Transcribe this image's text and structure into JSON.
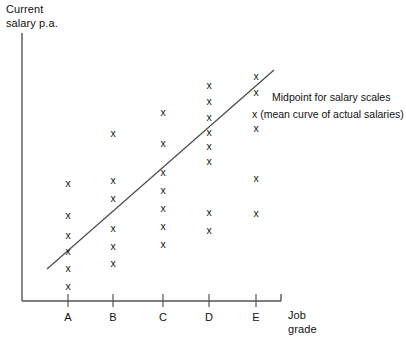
{
  "chart_data": {
    "type": "scatter",
    "title": "",
    "xlabel": "Job grade",
    "ylabel": "Current salary p.a.",
    "categories": [
      "A",
      "B",
      "C",
      "D",
      "E"
    ],
    "grid": false,
    "legend_position": "inside-right",
    "marker_symbol": "x",
    "series": [
      {
        "name": "Actual salaries",
        "type": "scatter",
        "points": [
          {
            "category": "A",
            "x": 68,
            "y": 183
          },
          {
            "category": "A",
            "x": 68,
            "y": 215
          },
          {
            "category": "A",
            "x": 68,
            "y": 235
          },
          {
            "category": "A",
            "x": 68,
            "y": 251
          },
          {
            "category": "A",
            "x": 68,
            "y": 268
          },
          {
            "category": "A",
            "x": 68,
            "y": 286
          },
          {
            "category": "B",
            "x": 113,
            "y": 133
          },
          {
            "category": "B",
            "x": 113,
            "y": 180
          },
          {
            "category": "B",
            "x": 113,
            "y": 198
          },
          {
            "category": "B",
            "x": 113,
            "y": 228
          },
          {
            "category": "B",
            "x": 113,
            "y": 246
          },
          {
            "category": "B",
            "x": 113,
            "y": 263
          },
          {
            "category": "C",
            "x": 163,
            "y": 112
          },
          {
            "category": "C",
            "x": 163,
            "y": 143
          },
          {
            "category": "C",
            "x": 163,
            "y": 172
          },
          {
            "category": "C",
            "x": 163,
            "y": 190
          },
          {
            "category": "C",
            "x": 163,
            "y": 208
          },
          {
            "category": "C",
            "x": 163,
            "y": 226
          },
          {
            "category": "C",
            "x": 163,
            "y": 244
          },
          {
            "category": "D",
            "x": 209,
            "y": 85
          },
          {
            "category": "D",
            "x": 209,
            "y": 101
          },
          {
            "category": "D",
            "x": 209,
            "y": 117
          },
          {
            "category": "D",
            "x": 209,
            "y": 132
          },
          {
            "category": "D",
            "x": 209,
            "y": 146
          },
          {
            "category": "D",
            "x": 209,
            "y": 161
          },
          {
            "category": "D",
            "x": 209,
            "y": 212
          },
          {
            "category": "D",
            "x": 209,
            "y": 230
          },
          {
            "category": "E",
            "x": 256,
            "y": 76
          },
          {
            "category": "E",
            "x": 256,
            "y": 92
          },
          {
            "category": "E",
            "x": 256,
            "y": 128
          },
          {
            "category": "E",
            "x": 256,
            "y": 178
          },
          {
            "category": "E",
            "x": 256,
            "y": 213
          }
        ],
        "counts_per_category": {
          "A": 6,
          "B": 6,
          "C": 7,
          "D": 8,
          "E": 5
        }
      },
      {
        "name": "Midpoint for salary scales",
        "type": "line",
        "line_start": {
          "x": 47,
          "y": 269
        },
        "line_end": {
          "x": 274,
          "y": 70
        }
      }
    ],
    "axes": {
      "origin": {
        "x": 22,
        "y": 301
      },
      "y_axis_top": {
        "x": 22,
        "y": 33
      },
      "x_axis_right": {
        "x": 281,
        "y": 301
      },
      "tick_positions": [
        68,
        113,
        163,
        209,
        256
      ],
      "tick_top_y": 294,
      "tick_bottom_y": 307
    },
    "legend": {
      "line_1": "Midpoint for salary scales",
      "line_2": "x (mean curve of actual salaries)"
    }
  },
  "labels": {
    "y_axis_title": "Current\nsalary p.a.",
    "x_axis_title": "Job\ngrade"
  }
}
